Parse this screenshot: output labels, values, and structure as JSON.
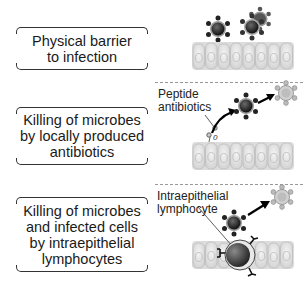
{
  "diagram": {
    "rows": [
      {
        "label": "Physical barrier to infection",
        "label_lines": [
          "Physical barrier",
          "to infection"
        ],
        "annotation": null
      },
      {
        "label": "Killing of microbes by locally produced antibiotics",
        "label_lines": [
          "Killing of microbes",
          "by locally produced",
          "antibiotics"
        ],
        "annotation_lines": [
          "Peptide",
          "antibiotics"
        ]
      },
      {
        "label": "Killing of microbes and infected cells by intraepithelial lymphocytes",
        "label_lines": [
          "Killing of microbes",
          "and infected cells",
          "by intraepithelial",
          "lymphocytes"
        ],
        "annotation_lines": [
          "Intraepithelial",
          "lymphocyte"
        ]
      }
    ],
    "colors": {
      "epithelium": "#d9d9d9",
      "microbe_core": "#1e1e1e",
      "dead_microbe": "#b5b5b5",
      "divider": "#999999"
    }
  }
}
